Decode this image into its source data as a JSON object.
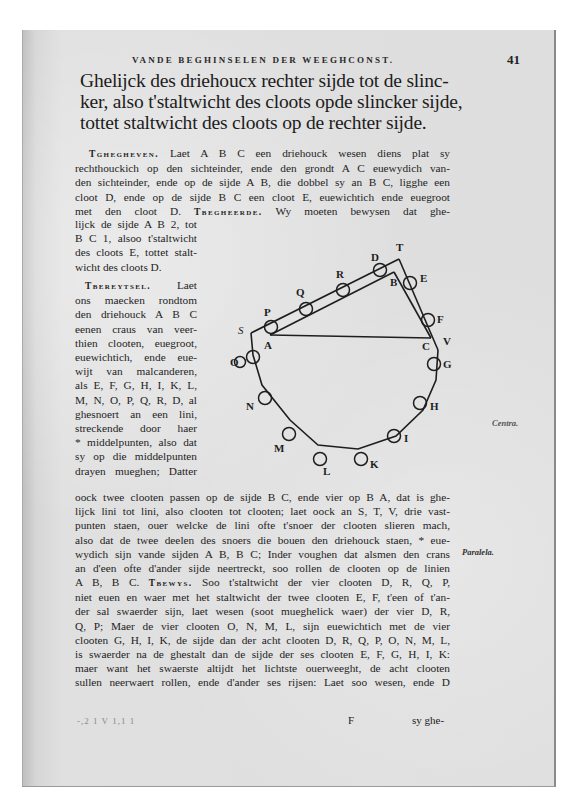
{
  "page": {
    "running_head": "Vande Beghinselen der Weeghconst.",
    "page_number": "41",
    "heading_lines": [
      "Ghelijck des driehoucx rechter sijde tot de slinc-",
      "ker, also t'staltwicht des cloots opde slincker sijde,",
      "tottet staltwicht des cloots op de rechter sijde."
    ],
    "paragraph_1": {
      "label": "Tghegheven.",
      "lines_full": [
        "Laet A B C een driehouck wesen diens plat sy",
        "rechthouckich op den sichteinder, ende den grondt A C euewydich van-",
        "den sichteinder, ende op de sijde A B, die dobbel sy an B C, ligghe een",
        "cloot D, ende op de sijde B C een cloot E, euewichtich ende euegroot"
      ],
      "line_5_start": "met den cloot D.",
      "label_2": "Tbegheerde.",
      "line_5_end": "Wy moeten bewysen dat ghe-",
      "lines_narrow": [
        "lijck de sijde A B 2, tot",
        "B C 1, alsoo t'staltwicht",
        "des cloots E, tottet stalt-",
        "wicht des cloots D."
      ]
    },
    "paragraph_2": {
      "label": "Tbereytsel.",
      "first_line_rest": "Laet",
      "lines_narrow": [
        "ons maecken rondtom",
        "den driehouck A B C",
        "eenen craus van veer-",
        "thien clooten, euegroot,",
        "euewichtich, ende eue-",
        "wijt van malcanderen,",
        "als E, F, G, H, I, K, L,",
        "M, N, O, P, Q, R, D, al",
        "ghesnoert an een lini,",
        "streckende door haer",
        "* middelpunten, also dat",
        "sy op die middelpunten",
        "drayen mueghen; Datter"
      ],
      "lines_full": [
        "oock twee clooten passen op de sijde B C, ende vier op B A, dat is ghe-",
        "lijck lini tot lini, also clooten tot clooten; laet oock an S, T, V, drie vast-",
        "punten staen, ouer welcke de lini ofte t'snoer der clooten slieren mach,",
        "also dat de twee deelen des snoers die bouen den driehouck staen, * eue-",
        "wydich sijn vande sijden A B, B C; Inder voughen dat alsmen den crans",
        "an d'een ofte d'ander sijde neertreckt, soo rollen de clooten op de linien"
      ]
    },
    "paragraph_3": {
      "line_1_start": "A B, B C.",
      "label": "Tbewys.",
      "line_1_end": "Soo t'staltwicht der vier clooten D, R, Q, P,",
      "lines_full": [
        "niet euen en waer met het staltwicht der twee clooten E, F, t'een of t'an-",
        "der sal swaerder sijn, laet wesen (soot mueghelick waer) der vier D, R,",
        "Q, P; Maer de vier clooten O, N, M, L, sijn euewichtich met de vier",
        "clooten G, H, I, K, de sijde dan der acht clooten D, R, Q, P, O, N, M, L,",
        "is swaerder na de ghestalt dan de sijde der ses clooten E, F, G, H, I, K:",
        "maer want het swaerste altijdt het lichtste ouerweeght, de acht clooten",
        "sullen neerwaert rollen, ende d'ander ses rijsen: Laet soo wesen, ende D"
      ]
    },
    "footer": {
      "signature": "F",
      "catchword": "sy ghe-",
      "ghost_text": "-,2 1 V   1,1 1"
    },
    "margin_notes": {
      "centra": "Centra.",
      "paralela": "Paralela."
    },
    "diagram": {
      "labels": {
        "A": "A",
        "B": "B",
        "C": "C",
        "D": "D",
        "E": "E",
        "F": "F",
        "G": "G",
        "H": "H",
        "I": "I",
        "K": "K",
        "L": "L",
        "M": "M",
        "N": "N",
        "O": "O",
        "P": "P",
        "Q": "Q",
        "R": "R",
        "S": "S",
        "T": "T",
        "V": "V"
      }
    }
  }
}
